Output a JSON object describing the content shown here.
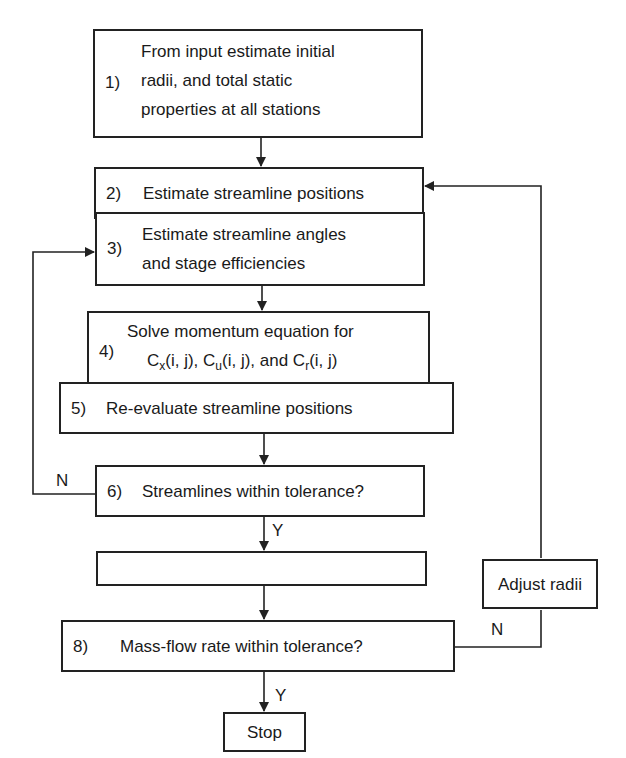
{
  "flowchart": {
    "steps": [
      {
        "num": "1)",
        "lines": [
          "From input estimate initial",
          "radii, and total static",
          "properties at all stations"
        ]
      },
      {
        "num": "2)",
        "lines": [
          "Estimate streamline positions"
        ]
      },
      {
        "num": "3)",
        "lines": [
          "Estimate streamline angles",
          "and stage efficiencies"
        ]
      },
      {
        "num": "4)",
        "lines": [
          "Solve momentum equation for",
          "C",
          "x",
          "(i, j), C",
          "u",
          "(i, j), and C",
          "r",
          "(i, j)"
        ]
      },
      {
        "num": "5)",
        "lines": [
          "Re-evaluate streamline positions"
        ]
      },
      {
        "num": "6)",
        "lines": [
          "Streamlines within tolerance?"
        ]
      },
      {
        "num": "7)",
        "lines": [
          "Evaluate total and static",
          "properties at all (i, j)"
        ]
      },
      {
        "num": "8)",
        "lines": [
          "Mass-flow rate within tolerance?"
        ]
      }
    ],
    "stop": "Stop",
    "adjust": "Adjust radii",
    "labels": {
      "n6": "N",
      "y6": "Y",
      "n8": "N",
      "y8": "Y"
    }
  }
}
